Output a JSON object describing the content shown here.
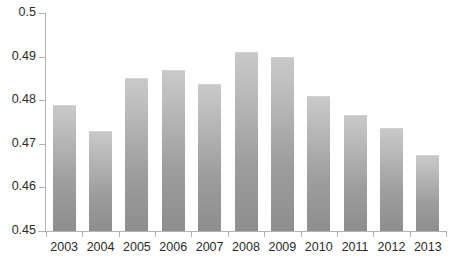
{
  "chart_data": {
    "type": "bar",
    "title": "",
    "xlabel": "",
    "ylabel": "",
    "categories": [
      "2003",
      "2004",
      "2005",
      "2006",
      "2007",
      "2008",
      "2009",
      "2010",
      "2011",
      "2012",
      "2013"
    ],
    "values": [
      0.479,
      0.473,
      0.485,
      0.487,
      0.4838,
      0.491,
      0.49,
      0.481,
      0.4767,
      0.4737,
      0.4675
    ],
    "ylim": [
      0.45,
      0.5
    ],
    "ytick_values": [
      0.45,
      0.46,
      0.47,
      0.48,
      0.49,
      0.5
    ],
    "ytick_labels": [
      "0.45",
      "0.46",
      "0.47",
      "0.48",
      "0.49",
      "0.5"
    ],
    "grid": false,
    "legend": null,
    "bar_color": "#a8a8a8",
    "axis_color": "#b3b3b3",
    "text_color": "#2b2b2b"
  }
}
